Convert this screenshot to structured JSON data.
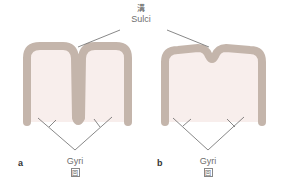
{
  "title": {
    "chinese": "溝",
    "english": "Sulci"
  },
  "figures": [
    {
      "id": "a",
      "label": "a",
      "description": "deeply folded cortex",
      "gyri_label": "Gyri",
      "gyri_chinese": "回"
    },
    {
      "id": "b",
      "label": "b",
      "description": "shallow folded cortex",
      "gyri_label": "Gyri",
      "gyri_chinese": "回"
    }
  ],
  "colors": {
    "cortex": "#c4b5ab",
    "interior": "#f8eeec",
    "lines": "#555555",
    "text": "#6e6e6e"
  }
}
